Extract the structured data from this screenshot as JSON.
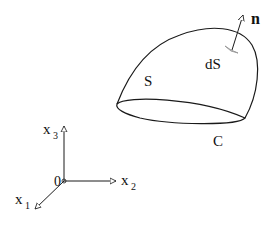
{
  "diagram": {
    "surface_label": "S",
    "element_label": "dS",
    "normal_label": "n",
    "boundary_label": "C",
    "axes": {
      "origin": "0",
      "x1": "x",
      "x1_sub": "1",
      "x2": "x",
      "x2_sub": "2",
      "x3": "x",
      "x3_sub": "3"
    },
    "colors": {
      "stroke": "#1a1a1a",
      "element": "#9a9a9a"
    }
  }
}
